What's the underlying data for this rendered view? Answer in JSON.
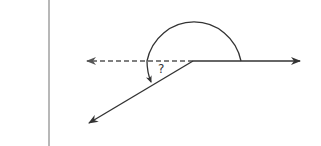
{
  "diagram": {
    "type": "angle-diagram",
    "unknown_angle_label": "?",
    "colors": {
      "line": "#333333",
      "dashed": "#555555",
      "divider": "#b8b8b8",
      "background": "#ffffff"
    },
    "vertex": {
      "x": 193,
      "y": 61
    },
    "rays": [
      {
        "name": "right-ray",
        "style": "solid",
        "to": {
          "x": 301,
          "y": 61
        }
      },
      {
        "name": "left-dashed-ray",
        "style": "dashed",
        "to": {
          "x": 86,
          "y": 61
        }
      },
      {
        "name": "lower-left-ray",
        "style": "solid",
        "to": {
          "x": 88,
          "y": 124
        }
      }
    ]
  }
}
